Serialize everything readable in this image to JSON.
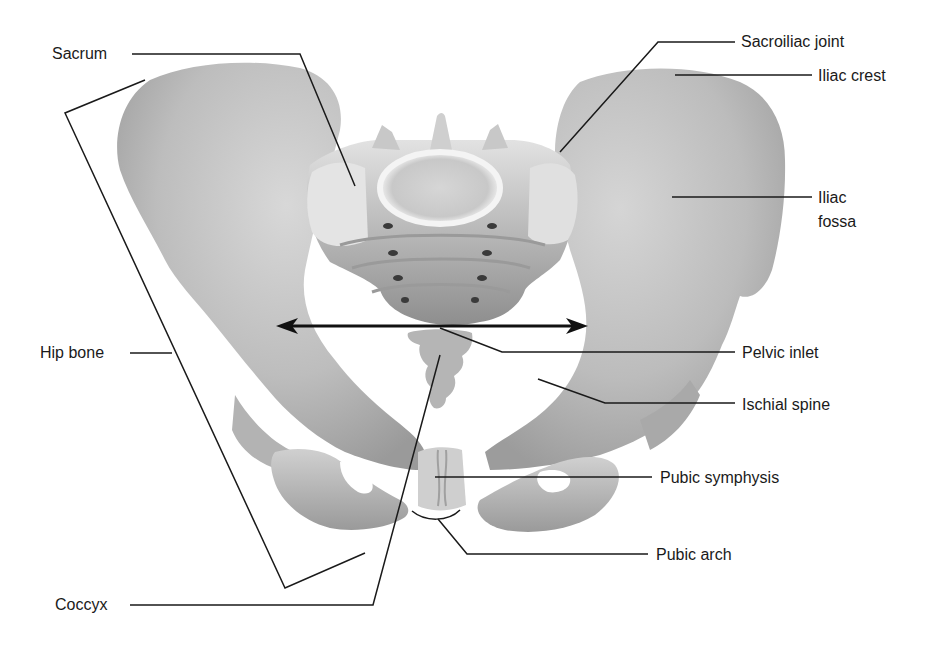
{
  "diagram": {
    "colors": {
      "background": "#ffffff",
      "bone_light": "#e6e6e6",
      "bone_mid": "#c4c4c4",
      "bone_dark": "#8a8a8a",
      "leader_line": "#1a1a1a",
      "label_text": "#1a1a1a"
    },
    "labels": {
      "sacrum": "Sacrum",
      "hip_bone": "Hip bone",
      "coccyx": "Coccyx",
      "sacroiliac_joint": "Sacroiliac joint",
      "iliac_crest": "Iliac crest",
      "iliac_fossa_line1": "Iliac",
      "iliac_fossa_line2": "fossa",
      "pelvic_inlet": "Pelvic inlet",
      "ischial_spine": "Ischial spine",
      "pubic_symphysis": "Pubic symphysis",
      "pubic_arch": "Pubic arch"
    },
    "annotations": [
      {
        "id": "sacrum",
        "side": "left",
        "text": "Sacrum"
      },
      {
        "id": "hip_bone",
        "side": "left",
        "text": "Hip bone"
      },
      {
        "id": "coccyx",
        "side": "left",
        "text": "Coccyx"
      },
      {
        "id": "sacroiliac_joint",
        "side": "right",
        "text": "Sacroiliac joint"
      },
      {
        "id": "iliac_crest",
        "side": "right",
        "text": "Iliac crest"
      },
      {
        "id": "iliac_fossa",
        "side": "right",
        "text": "Iliac fossa"
      },
      {
        "id": "pelvic_inlet",
        "side": "right",
        "text": "Pelvic inlet"
      },
      {
        "id": "ischial_spine",
        "side": "right",
        "text": "Ischial spine"
      },
      {
        "id": "pubic_symphysis",
        "side": "right",
        "text": "Pubic symphysis"
      },
      {
        "id": "pubic_arch",
        "side": "right",
        "text": "Pubic arch"
      }
    ],
    "markers": {
      "pelvic_inlet_arrow": "double-headed-arrow",
      "hip_bone_bracket": "bracket"
    }
  }
}
